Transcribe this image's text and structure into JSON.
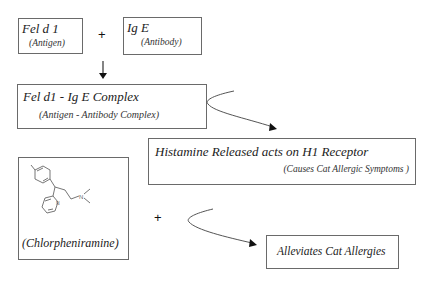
{
  "diagram": {
    "nodes": {
      "antigen": {
        "title": "Fel d 1",
        "subtitle": "(Antigen)"
      },
      "antibody": {
        "title": "Ig E",
        "subtitle": "(Antibody)"
      },
      "complex": {
        "title": "Fel d1 - Ig E Complex",
        "subtitle": "(Antigen - Antibody Complex)"
      },
      "histamine": {
        "title": "Histamine Released acts on H1 Receptor",
        "subtitle": "(Causes Cat Allergic Symptoms )"
      },
      "drug": {
        "caption": "(Chlorpheniramine)",
        "structure_icon": "chemical-structure"
      },
      "result": {
        "title": "Alleviates Cat Allergies"
      }
    },
    "operators": {
      "plus_top": "+",
      "plus_bottom": "+"
    },
    "colors": {
      "line": "#555555",
      "border": "#6a6a6a",
      "text": "#222222"
    }
  }
}
